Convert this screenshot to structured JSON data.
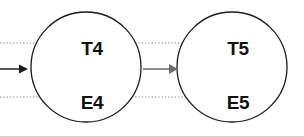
{
  "diagram": {
    "type": "directed-graph",
    "canvas": {
      "width": 304,
      "height": 137,
      "background": "#ffffff"
    },
    "colors": {
      "node_stroke": "#1a1a1a",
      "node_fill": "#ffffff",
      "label_text": "#111111",
      "dotted_edge": "#8c8c8c",
      "solid_edge": "#6e6e6e",
      "arrowhead_dark": "#1b1b1b"
    },
    "nodes": [
      {
        "id": "stage-4",
        "cx": 86,
        "cy": 67,
        "r": 55,
        "labels": [
          {
            "id": "T4",
            "text": "T4",
            "x": 92,
            "y": 50
          },
          {
            "id": "E4",
            "text": "E4",
            "x": 92,
            "y": 104
          }
        ]
      },
      {
        "id": "stage-5",
        "cx": 232,
        "cy": 67,
        "r": 55,
        "labels": [
          {
            "id": "T5",
            "text": "T5",
            "x": 238,
            "y": 50
          },
          {
            "id": "E5",
            "text": "E5",
            "x": 238,
            "y": 104
          }
        ]
      }
    ],
    "edges": [
      {
        "id": "edge-in-top",
        "style": "dotted",
        "from_x": 0,
        "to_x": 78,
        "y": 43
      },
      {
        "id": "edge-in-bottom",
        "style": "dotted",
        "from_x": 0,
        "to_x": 78,
        "y": 97
      },
      {
        "id": "edge-in-middle",
        "style": "solid",
        "from_x": 0,
        "to_x": 27,
        "y": 69
      },
      {
        "id": "edge-t4-t5",
        "style": "dotted",
        "from_x": 112,
        "to_x": 224,
        "y": 43
      },
      {
        "id": "edge-e4-e5",
        "style": "dotted",
        "from_x": 112,
        "to_x": 224,
        "y": 97
      },
      {
        "id": "edge-stage4-stage5",
        "style": "solid",
        "from_x": 146,
        "to_x": 177,
        "y": 69
      }
    ]
  }
}
